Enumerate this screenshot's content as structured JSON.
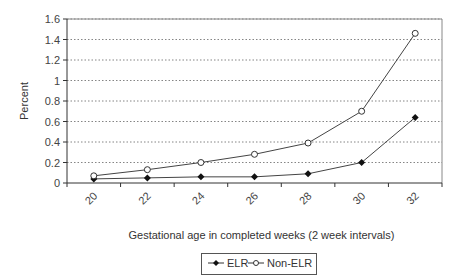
{
  "chart_data": {
    "type": "line",
    "title": "",
    "xlabel": "Gestational age in completed weeks (2 week intervals)",
    "ylabel": "Percent",
    "categories": [
      "20",
      "22",
      "24",
      "26",
      "28",
      "30",
      "32"
    ],
    "yticks": [
      "0",
      "0.2",
      "0.4",
      "0.6",
      "0.8",
      "1",
      "1.2",
      "1.4",
      "1.6"
    ],
    "ylim": [
      0,
      1.6
    ],
    "grid": "horizontal dotted",
    "legend_position": "bottom",
    "series": [
      {
        "name": "ELR",
        "marker": "filled-diamond",
        "values": [
          0.04,
          0.05,
          0.06,
          0.06,
          0.09,
          0.2,
          0.64
        ]
      },
      {
        "name": "Non-ELR",
        "marker": "open-circle",
        "values": [
          0.07,
          0.13,
          0.2,
          0.28,
          0.39,
          0.7,
          1.46
        ]
      }
    ]
  },
  "legend": {
    "elr": "ELR",
    "non_elr": "Non-ELR"
  }
}
